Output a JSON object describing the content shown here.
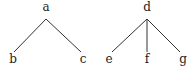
{
  "trees": [
    {
      "root": {
        "label": "a",
        "x": 46,
        "y": 11
      },
      "apex": {
        "x": 46,
        "y": 19
      },
      "children": [
        {
          "label": "b",
          "x": 13,
          "y": 63,
          "edge_end": {
            "x": 14,
            "y": 52
          }
        },
        {
          "label": "c",
          "x": 83,
          "y": 63,
          "edge_end": {
            "x": 81,
            "y": 52
          }
        }
      ]
    },
    {
      "root": {
        "label": "d",
        "x": 147,
        "y": 11
      },
      "apex": {
        "x": 147,
        "y": 19
      },
      "children": [
        {
          "label": "e",
          "x": 109,
          "y": 63,
          "edge_end": {
            "x": 112,
            "y": 52
          }
        },
        {
          "label": "f",
          "x": 147,
          "y": 63,
          "edge_end": {
            "x": 147,
            "y": 52
          }
        },
        {
          "label": "g",
          "x": 183,
          "y": 63,
          "edge_end": {
            "x": 180,
            "y": 52
          }
        }
      ]
    }
  ],
  "colors": {
    "edge": "#333333",
    "text": "#222222",
    "background": "#ffffff"
  }
}
